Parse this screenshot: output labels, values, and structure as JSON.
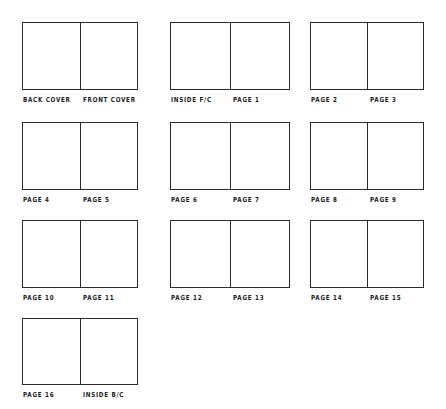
{
  "document": {
    "title": "Booklet Page Layout Storyboard",
    "description": "Hand-drawn grid of ten two-page spreads labelled for a sixteen page booklet plus covers",
    "ink_color": "#2b2b2b",
    "paper_color": "#ffffff",
    "spread_count": 10,
    "columns": 3,
    "rows": 4
  },
  "spreads": [
    {
      "id": "spread-1",
      "left_label": "BACK COVER",
      "right_label": "FRONT COVER",
      "row": 1,
      "column": 1
    },
    {
      "id": "spread-2",
      "left_label": "INSIDE F/C",
      "right_label": "PAGE 1",
      "row": 1,
      "column": 2
    },
    {
      "id": "spread-3",
      "left_label": "PAGE 2",
      "right_label": "PAGE 3",
      "row": 1,
      "column": 3
    },
    {
      "id": "spread-4",
      "left_label": "PAGE 4",
      "right_label": "PAGE 5",
      "row": 2,
      "column": 1
    },
    {
      "id": "spread-5",
      "left_label": "PAGE 6",
      "right_label": "PAGE 7",
      "row": 2,
      "column": 2
    },
    {
      "id": "spread-6",
      "left_label": "PAGE 8",
      "right_label": "PAGE 9",
      "row": 2,
      "column": 3
    },
    {
      "id": "spread-7",
      "left_label": "PAGE 10",
      "right_label": "PAGE 11",
      "row": 3,
      "column": 1
    },
    {
      "id": "spread-8",
      "left_label": "PAGE 12",
      "right_label": "PAGE 13",
      "row": 3,
      "column": 2
    },
    {
      "id": "spread-9",
      "left_label": "PAGE 14",
      "right_label": "PAGE 15",
      "row": 3,
      "column": 3
    },
    {
      "id": "spread-10",
      "left_label": "PAGE 16",
      "right_label": "INSIDE B/C",
      "row": 4,
      "column": 1
    }
  ],
  "geometry": {
    "canvas_width": 446,
    "canvas_height": 409,
    "column_x": [
      22,
      170,
      310
    ],
    "column_width": [
      116,
      120,
      114
    ],
    "row_y": [
      22,
      122,
      220,
      318
    ],
    "row_height": [
      68,
      68,
      68,
      67
    ]
  }
}
